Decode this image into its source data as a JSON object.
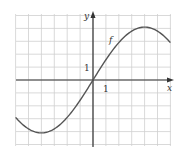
{
  "chart_data": {
    "type": "line",
    "title": "",
    "xlabel": "x",
    "ylabel": "y",
    "function_label": "f",
    "tick_labels": {
      "x_unit": "1",
      "y_unit": "1"
    },
    "xlim": [
      -6,
      6
    ],
    "ylim": [
      -5,
      5
    ],
    "grid": true,
    "grid_spacing": 1,
    "series": [
      {
        "name": "f",
        "x": [
          -6,
          -5,
          -4,
          -3,
          -2,
          -1,
          0,
          1,
          2,
          3,
          4,
          5,
          6
        ],
        "values": [
          -2.3,
          -3.6,
          -4.1,
          -3.7,
          -2.8,
          -1.5,
          0,
          1.5,
          2.8,
          3.7,
          4.1,
          3.6,
          2.3
        ]
      }
    ],
    "colors": {
      "curve": "#555555",
      "grid": "#cfcfcf",
      "axis": "#333333"
    }
  },
  "labels": {
    "x_axis": "x",
    "y_axis": "y",
    "curve": "f",
    "x_tick": "1",
    "y_tick": "1"
  }
}
